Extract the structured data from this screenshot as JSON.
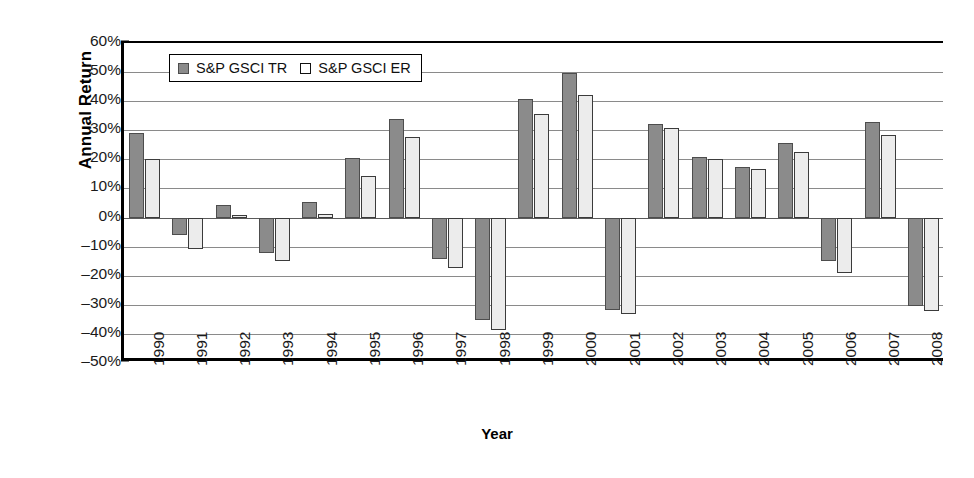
{
  "chart_data": {
    "type": "bar",
    "title": "",
    "xlabel": "Year",
    "ylabel": "Annual Return",
    "ylim": [
      -50,
      60
    ],
    "ytick_step": 10,
    "grid": true,
    "legend_position": "top-left-inside",
    "ytick_labels": [
      "60%",
      "50%",
      "40%",
      "30%",
      "20%",
      "10%",
      "0%",
      "–10%",
      "–20%",
      "–30%",
      "–40%",
      "–50%"
    ],
    "ytick_values": [
      60,
      50,
      40,
      30,
      20,
      10,
      0,
      -10,
      -20,
      -30,
      -40,
      -50
    ],
    "categories": [
      "1990",
      "1991",
      "1992",
      "1993",
      "1994",
      "1995",
      "1996",
      "1997",
      "1998",
      "1999",
      "2000",
      "2001",
      "2002",
      "2003",
      "2004",
      "2005",
      "2006",
      "2007",
      "2008"
    ],
    "series": [
      {
        "name": "S&P GSCI TR",
        "color": "#8b8b8b",
        "values": [
          29.1,
          -6.1,
          4.4,
          -12.3,
          5.3,
          20.3,
          33.9,
          -14.1,
          -35.3,
          40.9,
          49.7,
          -31.9,
          32.1,
          20.7,
          17.3,
          25.6,
          -15.1,
          32.7,
          -46.5
        ]
      },
      {
        "name": "S&P GSCI ER",
        "color": "#ececec",
        "values": [
          20.2,
          -10.9,
          0.8,
          -15.1,
          1.1,
          14.4,
          27.8,
          -17.5,
          -38.8,
          35.6,
          42.0,
          -33.3,
          30.7,
          20.2,
          16.6,
          22.7,
          -19.0,
          28.4,
          -32.0
        ]
      }
    ],
    "annotations": []
  },
  "display_values": {
    "tr": [
      29.1,
      -6.1,
      4.4,
      -12.3,
      5.3,
      20.3,
      33.9,
      -14.1,
      -35.3,
      40.9,
      49.7,
      -31.9,
      32.1,
      20.7,
      17.3,
      25.6,
      -15.1,
      32.7,
      -30.3
    ],
    "er": [
      20.2,
      -10.9,
      0.8,
      -15.1,
      1.1,
      14.4,
      27.8,
      -17.5,
      -38.8,
      35.6,
      42.0,
      -33.3,
      30.7,
      20.2,
      16.6,
      22.7,
      -19.0,
      28.4,
      -32.0
    ]
  },
  "axes": {
    "y_title": "Annual Return",
    "x_title": "Year"
  },
  "legend": {
    "items": [
      {
        "label": "S&P GSCI TR",
        "swatch": "filled-gray-square"
      },
      {
        "label": "S&P GSCI ER",
        "swatch": "empty-white-square"
      }
    ]
  },
  "colors": {
    "series_tr": "#8b8b8b",
    "series_er": "#ececec",
    "gridline": "#8a8a8a",
    "axis": "#000000",
    "background": "#ffffff"
  }
}
